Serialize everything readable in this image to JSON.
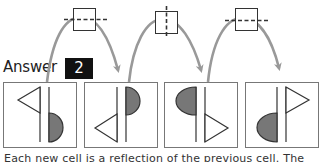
{
  "answer": {
    "label": "Answer",
    "value": "2"
  },
  "colors": {
    "arrow": "#999999",
    "shape_fill": "#777777",
    "stroke": "#333333",
    "badge_bg": "#111111",
    "badge_text": "#ffffff"
  },
  "transforms": [
    {
      "icon": "reflect-horizontal-axis-icon",
      "axis": "horizontal"
    },
    {
      "icon": "reflect-vertical-axis-icon",
      "axis": "vertical"
    },
    {
      "icon": "reflect-horizontal-axis-icon",
      "axis": "horizontal"
    }
  ],
  "cells": [
    {
      "index": 1,
      "left_symbol": "triangle-left-top",
      "right_symbol": "half-disk-right-bottom"
    },
    {
      "index": 2,
      "left_symbol": "triangle-left-bottom",
      "right_symbol": "half-disk-right-top"
    },
    {
      "index": 3,
      "left_symbol": "half-disk-left-top",
      "right_symbol": "triangle-right-bottom"
    },
    {
      "index": 4,
      "left_symbol": "half-disk-left-bottom",
      "right_symbol": "triangle-right-top"
    }
  ],
  "caption": "Each new cell is a reflection of the previous cell. The"
}
